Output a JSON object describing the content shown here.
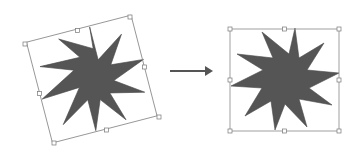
{
  "diagram": {
    "colors": {
      "star_fill": "#555555",
      "box_stroke": "#888888",
      "handle_fill": "#ffffff",
      "handle_stroke": "#777777",
      "arrow": "#555555"
    },
    "left": {
      "label": "rotated-star",
      "center": [
        92,
        80
      ],
      "rotation_deg": -14.5,
      "box_corners": [
        [
          25,
          44
        ],
        [
          130,
          17
        ],
        [
          159,
          117
        ],
        [
          54,
          143
        ]
      ]
    },
    "right": {
      "label": "upright-star",
      "box": {
        "x": 230,
        "y": 29,
        "w": 109,
        "h": 102
      }
    },
    "arrow": {
      "x1": 170,
      "y1": 71,
      "x2": 213,
      "y2": 71
    }
  }
}
